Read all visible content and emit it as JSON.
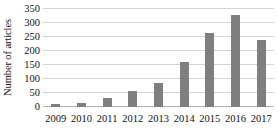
{
  "chart_data": {
    "type": "bar",
    "title": "",
    "xlabel": "",
    "ylabel": "Number of articles",
    "categories": [
      "2009",
      "2010",
      "2011",
      "2012",
      "2013",
      "2014",
      "2015",
      "2016",
      "2017"
    ],
    "values": [
      10,
      15,
      32,
      57,
      85,
      160,
      265,
      330,
      240
    ],
    "series": [
      {
        "name": "Number of articles",
        "values": [
          10,
          15,
          32,
          57,
          85,
          160,
          265,
          330,
          240
        ]
      }
    ],
    "ylim": [
      0,
      350
    ],
    "ytick_values": [
      0,
      50,
      100,
      150,
      200,
      250,
      300,
      350
    ],
    "ytick_labels": [
      "0",
      "50",
      "100",
      "150",
      "200",
      "250",
      "300",
      "350"
    ],
    "grid": true,
    "grid_axis": "y",
    "legend": false,
    "legend_position": "none",
    "bar_color": "#7f7f7f",
    "gridline_color": "#d4d4d4",
    "axis_color": "#b3b3b3",
    "background_color": "#ffffff",
    "text_color": "#111111"
  }
}
